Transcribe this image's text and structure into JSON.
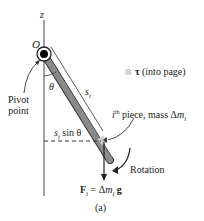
{
  "diagram": {
    "axis_label": "z",
    "origin_label": "O",
    "angle_label": "θ",
    "rod_length_label": "s",
    "rod_length_sub": "i",
    "pivot_label_line1": "Pivot",
    "pivot_label_line2": "point",
    "horizontal_distance_label": "s",
    "horizontal_distance_sub": "i",
    "horizontal_distance_rest": " sin θ",
    "torque_symbol": "⊗",
    "torque_vector": "τ",
    "torque_note": " (into page)",
    "piece_sup": "th",
    "piece_i": "i",
    "piece_label": " piece, mass Δ",
    "piece_m": "m",
    "piece_sub": "i",
    "rotation_label": "Rotation",
    "force_F": "F",
    "force_sub": "i",
    "force_eq": " = Δ",
    "force_m": "m",
    "force_m_sub": "i",
    "force_g": " g",
    "caption": "(a)"
  },
  "colors": {
    "rod_fill": "#8a8a8a",
    "line": "#333333",
    "pivot": "#000000"
  }
}
